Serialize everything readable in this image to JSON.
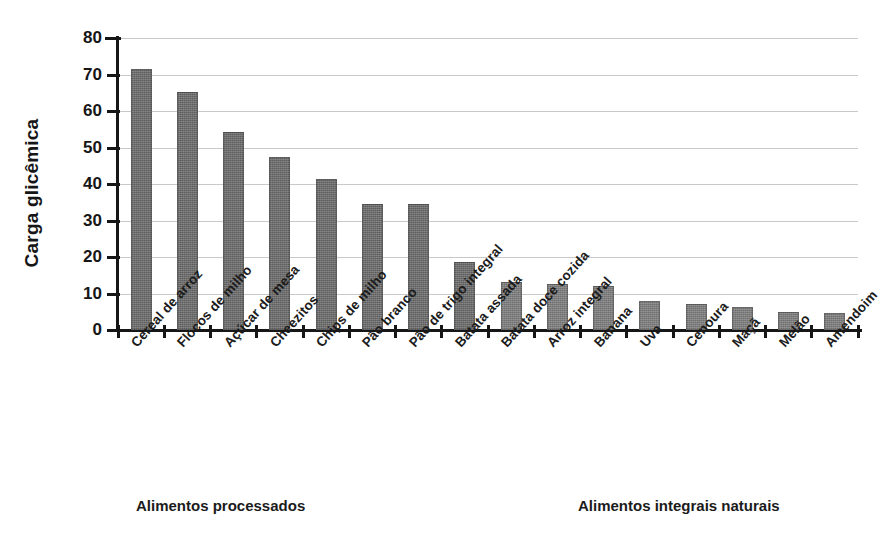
{
  "chart_data": {
    "type": "bar",
    "title": "",
    "xlabel": "",
    "ylabel": "Carga glicêmica",
    "ylim": [
      0,
      80
    ],
    "ytick_values": [
      0,
      10,
      20,
      30,
      40,
      50,
      60,
      70,
      80
    ],
    "ytick_labels": [
      "0",
      "10",
      "20",
      "30",
      "40",
      "50",
      "60",
      "70",
      "80"
    ],
    "grid": true,
    "legend": "none",
    "bar_color": "#5d5d5d",
    "bar_color_light": "#6f6f6f",
    "categories": [
      "Cereal de arroz",
      "Flocos de milho",
      "Açúcar de mesa",
      "Cheezitos",
      "Chips de milho",
      "Pão branco",
      "Pão de trigo integral",
      "Batata assada",
      "Batata doce cozida",
      "Arroz integral",
      "Banana",
      "Uva",
      "Cenoura",
      "Maçã",
      "Melão",
      "Amendoim"
    ],
    "values": [
      71.5,
      65.2,
      54.2,
      47.3,
      41.5,
      34.5,
      34.5,
      18.5,
      13.2,
      12.5,
      12.0,
      8.0,
      7.2,
      6.3,
      4.8,
      4.7
    ],
    "group_labels": {
      "left": "Alimentos processados",
      "right": "Alimentos integrais naturais"
    },
    "group_split_index": 8
  }
}
